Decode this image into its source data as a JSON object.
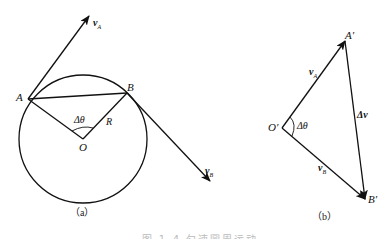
{
  "figure": {
    "caption_partial": "图 1-4  匀速圆周运动",
    "panel_a": {
      "caption": "（a）",
      "labels": {
        "A": "A",
        "B": "B",
        "O": "O",
        "R": "R",
        "delta_theta": "Δθ",
        "vA_main": "v",
        "vA_sub": "A",
        "vB_main": "v",
        "vB_sub": "B"
      },
      "geometry": {
        "center": [
          83,
          139
        ],
        "radius": 64,
        "A": [
          28,
          99
        ],
        "B": [
          127,
          93
        ],
        "vA_tip": [
          89,
          16
        ],
        "vB_tip": [
          210,
          181
        ]
      }
    },
    "panel_b": {
      "caption": "（b）",
      "labels": {
        "O_prime": "O′",
        "A_prime": "A′",
        "B_prime": "B′",
        "delta_theta": "Δθ",
        "delta_v": "Δv",
        "vA_main": "v",
        "vA_sub": "A",
        "vB_main": "v",
        "vB_sub": "B"
      },
      "geometry": {
        "O_prime": [
          282,
          128
        ],
        "A_prime": [
          345,
          41
        ],
        "B_prime": [
          365,
          199
        ]
      }
    },
    "colors": {
      "line": "#111111",
      "background": "#ffffff"
    }
  }
}
